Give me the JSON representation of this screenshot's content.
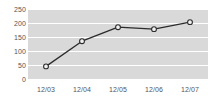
{
  "chart_data": {
    "type": "line",
    "title": "",
    "xlabel": "",
    "ylabel": "",
    "categories": [
      "12/03",
      "12/04",
      "12/05",
      "12/06",
      "12/07"
    ],
    "values": [
      45,
      135,
      185,
      178,
      203
    ],
    "series": [
      {
        "name": "series-1",
        "values": [
          45,
          135,
          185,
          178,
          203
        ]
      }
    ],
    "ylim": [
      0,
      250
    ],
    "y_ticks": [
      0,
      50,
      100,
      150,
      200,
      250
    ],
    "y_tick_labels": [
      "0",
      "50",
      "100",
      "150",
      "200",
      "250"
    ],
    "x_tick_labels": [
      "12/03",
      "12/04",
      "12/05",
      "12/06",
      "12/07"
    ],
    "grid": true,
    "grid_axis": "y",
    "legend": false,
    "legend_position": "none",
    "marker": "circle-open",
    "colors": {
      "plot_background": "#d9d9d9",
      "gridline": "#ffffff",
      "line": "#2b2b2b",
      "marker_fill": "#f2f2f2",
      "tick_label": "#555555",
      "page_background": "#ffffff"
    }
  }
}
